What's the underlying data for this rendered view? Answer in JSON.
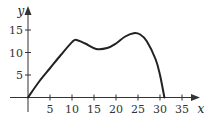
{
  "chart_data": {
    "type": "line",
    "title": "",
    "xlabel": "x",
    "ylabel": "y",
    "xlim": [
      0,
      37
    ],
    "ylim": [
      0,
      18
    ],
    "x_ticks": [
      5,
      10,
      15,
      20,
      25,
      30,
      35
    ],
    "x_tick_labels": [
      "5",
      "10",
      "15",
      "20",
      "25",
      "30",
      "35"
    ],
    "y_ticks": [
      5,
      10,
      15
    ],
    "y_tick_labels": [
      "5",
      "10",
      "15"
    ],
    "grid": false,
    "legend": "none",
    "series": [
      {
        "name": "curve",
        "x": [
          0,
          2.5,
          5,
          7.5,
          10,
          11,
          13,
          15.5,
          18,
          20,
          22,
          24,
          25.5,
          27,
          29,
          30,
          31
        ],
        "y": [
          0,
          3.5,
          6.5,
          9.5,
          12.3,
          12.8,
          12,
          10.8,
          11,
          12,
          13.5,
          14.3,
          14,
          12.5,
          8.5,
          5,
          0
        ]
      }
    ]
  }
}
